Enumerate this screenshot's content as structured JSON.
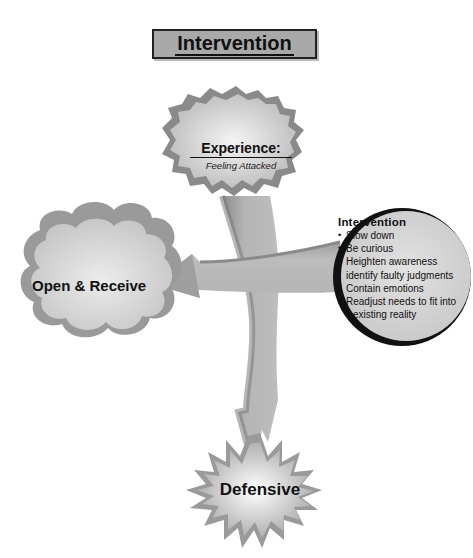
{
  "title": "Intervention",
  "nodes": {
    "experience": {
      "title": "Experience:",
      "subtitle": "Feeling Attacked",
      "shape": "cloud-jagged"
    },
    "open_receive": {
      "label": "Open & Receive",
      "shape": "cloud"
    },
    "defensive": {
      "label": "Defensive",
      "shape": "starburst"
    },
    "intervention": {
      "heading": "Intervention",
      "shape": "circle",
      "items": [
        "Slow down",
        "Be curious",
        "Heighten awareness",
        "identify faulty judgments",
        "Contain emotions",
        "Readjust needs to fit into existing reality"
      ],
      "items_display": [
        {
          "line1": "Slow down"
        },
        {
          "line1": "Be curious"
        },
        {
          "line1": "Heighten awareness"
        },
        {
          "line1": "identify faulty judgments"
        },
        {
          "line1": "Contain emotions"
        },
        {
          "line1": "Readjust needs to fit into",
          "line2": "existing reality"
        }
      ]
    }
  },
  "arrows": [
    {
      "from": "experience",
      "to": "defensive",
      "icon": "arrow-down-icon"
    },
    {
      "from": "intervention",
      "to": "open_receive",
      "icon": "arrow-left-icon"
    }
  ],
  "colors": {
    "background": "#ffffff",
    "title_box": "#a9a9a9",
    "arrow_light": "#b4b4b4",
    "arrow_dark": "#8a8a8a",
    "shape_light": "#e6e6e6",
    "shape_dark": "#9a9a9a",
    "outline": "#111111"
  }
}
